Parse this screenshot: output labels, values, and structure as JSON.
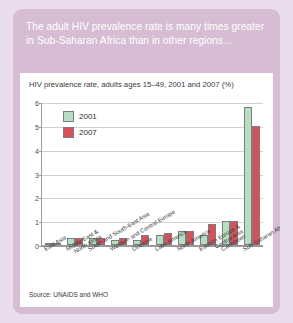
{
  "headline": "The adult HIV prevalence rate is many times greater in Sub-Saharan Africa than in other regions...",
  "source": "Source: UNAIDS and WHO",
  "colors": {
    "page_background": "#e9dcec",
    "card_background": "#d6bdd3",
    "panel_background": "#ffffff",
    "series_2001": "#b7dec2",
    "series_2007": "#d6525b",
    "gridline": "#d2d2d2",
    "axis": "#9a9a9a"
  },
  "chart_data": {
    "type": "bar",
    "title": "HIV prevalence rate, adults ages 15–49, 2001 and 2007 (%)",
    "xlabel": "",
    "ylabel": "",
    "ylim": [
      0,
      6
    ],
    "yticks": [
      0,
      1,
      2,
      3,
      4,
      5,
      6
    ],
    "grid": true,
    "legend_position": "top-left",
    "categories": [
      "East Asia",
      "Middle East & North Africa",
      "South and South-East Asia",
      "Western and Central Europe",
      "Oceania",
      "Latin America",
      "North America",
      "Eastern Europe & Central Asia",
      "Caribbean",
      "Sub-Saharan Africa"
    ],
    "category_lines": [
      [
        "East Asia"
      ],
      [
        "Middle East &",
        "North Africa"
      ],
      [
        "South and South-East Asia"
      ],
      [
        "Western and Central Europe"
      ],
      [
        "Oceania"
      ],
      [
        "Latin America"
      ],
      [
        "North America"
      ],
      [
        "Eastern Europe &",
        "Central Asia"
      ],
      [
        "Caribbean"
      ],
      [
        "Sub-Saharan Africa"
      ]
    ],
    "series": [
      {
        "name": "2001",
        "color": "#b7dec2",
        "values": [
          0.1,
          0.3,
          0.3,
          0.2,
          0.2,
          0.4,
          0.6,
          0.4,
          1.0,
          5.8
        ]
      },
      {
        "name": "2007",
        "color": "#d6525b",
        "values": [
          0.1,
          0.3,
          0.3,
          0.3,
          0.4,
          0.5,
          0.6,
          0.9,
          1.0,
          5.0
        ]
      }
    ]
  }
}
